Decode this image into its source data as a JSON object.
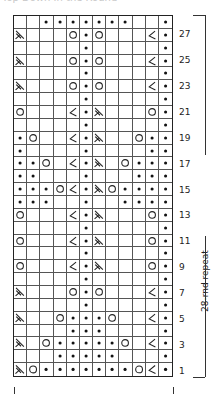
{
  "title": "Top Down In the Round",
  "chart": {
    "columns": 12,
    "rows_count": 28,
    "legend_symbols": {
      "": "knit (empty)",
      "p": "purl (dot)",
      "o": "yarn over (circle)",
      "L": "left-leaning decrease (ssk)",
      "R": "right-leaning decrease (k2tog)"
    },
    "rows": [
      {
        "num": 28,
        "label": "",
        "cells": [
          "",
          "",
          "p",
          "p",
          "p",
          "p",
          "p",
          "p",
          "p",
          "",
          "",
          "p"
        ]
      },
      {
        "num": 27,
        "label": "27",
        "cells": [
          "L",
          "",
          "",
          "",
          "o",
          "p",
          "o",
          "",
          "",
          "",
          "R",
          "p"
        ]
      },
      {
        "num": 26,
        "label": "",
        "cells": [
          "",
          "",
          "",
          "",
          "",
          "p",
          "",
          "",
          "",
          "",
          "",
          "p"
        ]
      },
      {
        "num": 25,
        "label": "25",
        "cells": [
          "L",
          "",
          "",
          "",
          "o",
          "p",
          "o",
          "",
          "",
          "",
          "R",
          "p"
        ]
      },
      {
        "num": 24,
        "label": "",
        "cells": [
          "",
          "",
          "",
          "",
          "",
          "p",
          "",
          "",
          "",
          "",
          "",
          "p"
        ]
      },
      {
        "num": 23,
        "label": "23",
        "cells": [
          "L",
          "",
          "",
          "",
          "o",
          "p",
          "o",
          "",
          "",
          "",
          "R",
          "p"
        ]
      },
      {
        "num": 22,
        "label": "",
        "cells": [
          "",
          "",
          "",
          "",
          "",
          "p",
          "",
          "",
          "",
          "",
          "",
          "p"
        ]
      },
      {
        "num": 21,
        "label": "21",
        "cells": [
          "o",
          "",
          "",
          "",
          "R",
          "p",
          "L",
          "",
          "",
          "",
          "o",
          "p"
        ]
      },
      {
        "num": 20,
        "label": "",
        "cells": [
          "",
          "",
          "",
          "",
          "",
          "p",
          "",
          "",
          "",
          "",
          "",
          "p"
        ]
      },
      {
        "num": 19,
        "label": "19",
        "cells": [
          "p",
          "o",
          "",
          "",
          "R",
          "p",
          "L",
          "",
          "",
          "o",
          "p",
          "p"
        ]
      },
      {
        "num": 18,
        "label": "",
        "cells": [
          "p",
          "",
          "",
          "",
          "",
          "p",
          "",
          "",
          "",
          "",
          "p",
          "p"
        ]
      },
      {
        "num": 17,
        "label": "17",
        "cells": [
          "p",
          "p",
          "o",
          "",
          "R",
          "p",
          "L",
          "",
          "o",
          "p",
          "p",
          "p"
        ]
      },
      {
        "num": 16,
        "label": "",
        "cells": [
          "p",
          "p",
          "",
          "",
          "",
          "p",
          "",
          "",
          "",
          "p",
          "p",
          "p"
        ]
      },
      {
        "num": 15,
        "label": "15",
        "cells": [
          "p",
          "p",
          "p",
          "o",
          "R",
          "p",
          "L",
          "o",
          "p",
          "p",
          "p",
          "p"
        ]
      },
      {
        "num": 14,
        "label": "",
        "cells": [
          "p",
          "p",
          "p",
          "",
          "",
          "p",
          "",
          "",
          "p",
          "p",
          "p",
          "p"
        ]
      },
      {
        "num": 13,
        "label": "13",
        "cells": [
          "o",
          "",
          "",
          "",
          "R",
          "p",
          "L",
          "",
          "",
          "",
          "o",
          "p"
        ]
      },
      {
        "num": 12,
        "label": "",
        "cells": [
          "",
          "",
          "",
          "",
          "",
          "p",
          "",
          "",
          "",
          "",
          "",
          "p"
        ]
      },
      {
        "num": 11,
        "label": "11",
        "cells": [
          "o",
          "",
          "",
          "",
          "R",
          "p",
          "L",
          "",
          "",
          "",
          "o",
          "p"
        ]
      },
      {
        "num": 10,
        "label": "",
        "cells": [
          "",
          "",
          "",
          "",
          "",
          "p",
          "",
          "",
          "",
          "",
          "",
          "p"
        ]
      },
      {
        "num": 9,
        "label": "9",
        "cells": [
          "o",
          "",
          "",
          "",
          "R",
          "p",
          "L",
          "",
          "",
          "",
          "o",
          "p"
        ]
      },
      {
        "num": 8,
        "label": "",
        "cells": [
          "",
          "",
          "",
          "",
          "",
          "p",
          "",
          "",
          "",
          "",
          "",
          "p"
        ]
      },
      {
        "num": 7,
        "label": "7",
        "cells": [
          "L",
          "",
          "",
          "",
          "o",
          "p",
          "o",
          "",
          "",
          "",
          "R",
          "p"
        ]
      },
      {
        "num": 6,
        "label": "",
        "cells": [
          "",
          "",
          "",
          "",
          "",
          "p",
          "",
          "",
          "",
          "",
          "",
          "p"
        ]
      },
      {
        "num": 5,
        "label": "5",
        "cells": [
          "L",
          "",
          "",
          "o",
          "p",
          "p",
          "p",
          "o",
          "",
          "",
          "R",
          "p"
        ]
      },
      {
        "num": 4,
        "label": "",
        "cells": [
          "",
          "",
          "",
          "",
          "p",
          "p",
          "p",
          "",
          "",
          "",
          "",
          "p"
        ]
      },
      {
        "num": 3,
        "label": "3",
        "cells": [
          "L",
          "",
          "o",
          "p",
          "p",
          "p",
          "p",
          "p",
          "o",
          "",
          "R",
          "p"
        ]
      },
      {
        "num": 2,
        "label": "",
        "cells": [
          "",
          "",
          "",
          "p",
          "p",
          "p",
          "p",
          "p",
          "",
          "",
          "",
          "p"
        ]
      },
      {
        "num": 1,
        "label": "1",
        "cells": [
          "L",
          "o",
          "p",
          "p",
          "p",
          "p",
          "p",
          "p",
          "p",
          "o",
          "R",
          "p"
        ]
      }
    ],
    "repeat_label": "28-rnd repeat"
  },
  "colors": {
    "ink": "#222222",
    "grid_line": "#555555",
    "background": "#ffffff"
  }
}
